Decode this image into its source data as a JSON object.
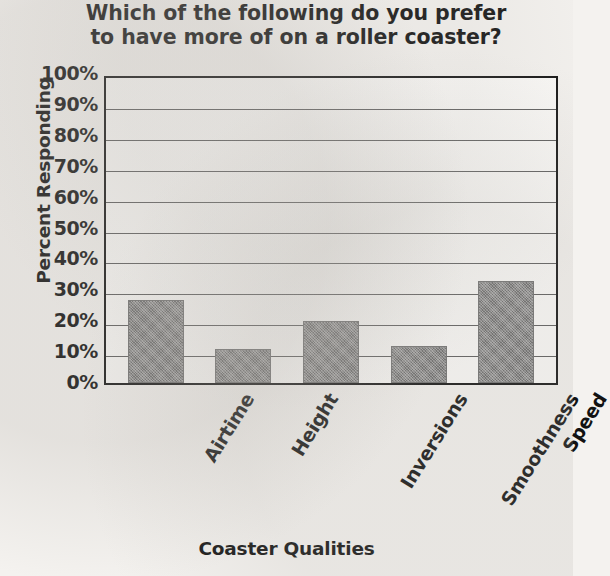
{
  "chart_data": {
    "type": "bar",
    "title": "Which of the following do you prefer to have more of on a roller coaster?",
    "title_line1": "Which of the following do you prefer",
    "title_line2": "to have more of on a roller coaster?",
    "xlabel": "Coaster Qualities",
    "ylabel": "Percent Responding",
    "categories": [
      "Airtime",
      "Height",
      "Inversions",
      "Smoothness",
      "Speed"
    ],
    "values": [
      27,
      11,
      20,
      12,
      33
    ],
    "ylim": [
      0,
      100
    ],
    "ytick_labels": [
      "100%",
      "90%",
      "80%",
      "70%",
      "60%",
      "50%",
      "40%",
      "30%",
      "20%",
      "10%",
      "0%"
    ],
    "ytick_values": [
      100,
      90,
      80,
      70,
      60,
      50,
      40,
      30,
      20,
      10,
      0
    ],
    "grid": true,
    "legend": "none",
    "bar_color": "#848484",
    "axis_color": "#111111",
    "gridline_color": "#5a5a5a",
    "background_color": "#f4f2ef"
  }
}
